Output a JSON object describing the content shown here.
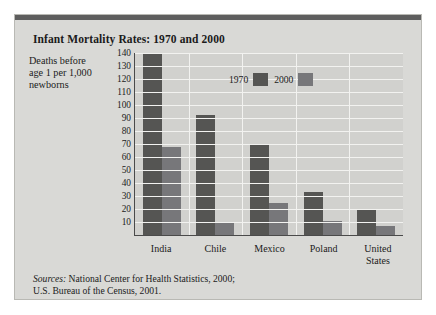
{
  "chart_data": {
    "type": "bar",
    "title": "Infant Mortality Rates: 1970 and 2000",
    "ylabel": "Deaths before age 1 per 1,000 newborns",
    "xlabel": "",
    "categories": [
      "India",
      "Chile",
      "Mexico",
      "Poland",
      "United States"
    ],
    "series": [
      {
        "name": "1970",
        "color": "#555553",
        "values": [
          139,
          92,
          70,
          33,
          20
        ]
      },
      {
        "name": "2000",
        "color": "#77777a",
        "values": [
          68,
          10,
          25,
          11,
          7
        ]
      }
    ],
    "ylim": [
      0,
      140
    ],
    "yticks": [
      140,
      130,
      120,
      110,
      100,
      90,
      80,
      70,
      60,
      50,
      40,
      30,
      20,
      10
    ],
    "grid": true,
    "legend_position": "top-center"
  },
  "axis_caption": {
    "line1": "Deaths before",
    "line2": "age 1 per 1,000",
    "line3": "newborns"
  },
  "xlabels": [
    {
      "line1": "India",
      "line2": ""
    },
    {
      "line1": "Chile",
      "line2": ""
    },
    {
      "line1": "Mexico",
      "line2": ""
    },
    {
      "line1": "Poland",
      "line2": ""
    },
    {
      "line1": "United",
      "line2": "States"
    }
  ],
  "sources": {
    "label": "Sources:",
    "line1": " National Center for Health Statistics, 2000;",
    "line2": "U.S. Bureau of the Census, 2001."
  }
}
